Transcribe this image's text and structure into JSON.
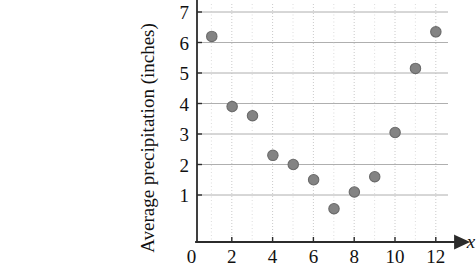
{
  "chart_data": {
    "type": "scatter",
    "title": "",
    "xlabel": "x",
    "ylabel": "Average precipitation (inches)",
    "x": [
      1,
      2,
      3,
      4,
      5,
      6,
      7,
      8,
      9,
      10,
      11,
      12
    ],
    "values": [
      6.2,
      3.9,
      3.6,
      2.3,
      2.0,
      1.5,
      0.55,
      1.1,
      1.6,
      3.05,
      5.15,
      6.35
    ],
    "points": [
      {
        "x": 1,
        "y": 6.2
      },
      {
        "x": 2,
        "y": 3.9
      },
      {
        "x": 3,
        "y": 3.6
      },
      {
        "x": 4,
        "y": 2.3
      },
      {
        "x": 5,
        "y": 2.0
      },
      {
        "x": 6,
        "y": 1.5
      },
      {
        "x": 7,
        "y": 0.55
      },
      {
        "x": 8,
        "y": 1.1
      },
      {
        "x": 9,
        "y": 1.6
      },
      {
        "x": 10,
        "y": 3.05
      },
      {
        "x": 11,
        "y": 5.15
      },
      {
        "x": 12,
        "y": 6.35
      }
    ],
    "xlim": [
      0,
      12.9
    ],
    "ylim": [
      0,
      7.25
    ],
    "xticks": [
      0,
      2,
      4,
      6,
      8,
      10,
      12
    ],
    "xticklabels": [
      "0",
      "2",
      "4",
      "6",
      "8",
      "10",
      "12"
    ],
    "yticks": [
      1,
      2,
      3,
      4,
      5,
      6,
      7
    ],
    "yticklabels": [
      "1",
      "2",
      "3",
      "4",
      "5",
      "6",
      "7"
    ],
    "x_minor_step": 1,
    "grid": {
      "horizontal": true,
      "vertical": true,
      "horizontal_style": "solid-gray",
      "vertical_style": "dotted-gray"
    },
    "legend": null,
    "marker": {
      "shape": "circle",
      "fill_color": "#838383",
      "edge_color": "#6a6a6a",
      "radius_px": 5.2
    },
    "axes_style": {
      "x_axis_arrow": true,
      "y_axis_arrow": false,
      "y_axis_cropped_top": true,
      "axis_color": "#2b2b2b",
      "background": "#ffffff"
    }
  },
  "labels": {
    "y_axis_title": "Average precipitation (inches)",
    "x_axis_variable": "x",
    "xtick_0": "0",
    "xtick_2": "2",
    "xtick_4": "4",
    "xtick_6": "6",
    "xtick_8": "8",
    "xtick_10": "10",
    "xtick_12": "12",
    "ytick_1": "1",
    "ytick_2": "2",
    "ytick_3": "3",
    "ytick_4": "4",
    "ytick_5": "5",
    "ytick_6": "6",
    "ytick_7": "7"
  }
}
